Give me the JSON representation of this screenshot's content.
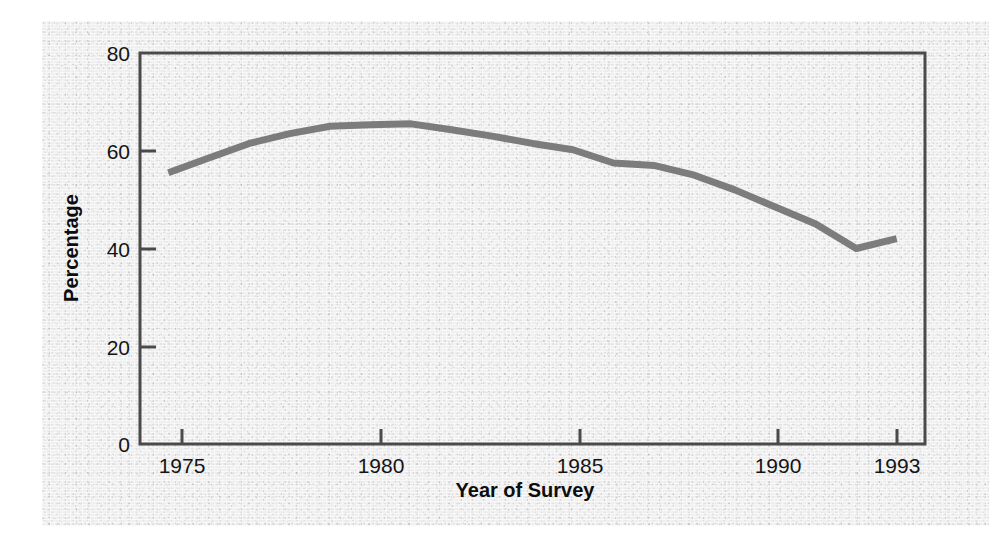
{
  "figure": {
    "background_color": "#efeff0",
    "page_color": "#ffffff"
  },
  "chart_data": {
    "type": "line",
    "title": "",
    "subtitle": "",
    "xlabel": "Year of Survey",
    "ylabel": "Percentage",
    "xlim": [
      1974.3,
      1993.7
    ],
    "ylim": [
      0,
      80
    ],
    "xticks": [
      1975,
      1980,
      1985,
      1990,
      1993
    ],
    "xtick_labels": [
      "1975",
      "1980",
      "1985",
      "1990",
      "1993"
    ],
    "yticks": [
      0,
      20,
      40,
      60,
      80
    ],
    "ytick_labels": [
      "0",
      "20",
      "40",
      "60",
      "80"
    ],
    "grid": false,
    "legend": false,
    "legend_position": "none",
    "annotations": [],
    "line_color": "#7c7c7c",
    "line_width": 7,
    "axis_color": "#4a4a4a",
    "x": [
      1975,
      1976,
      1977,
      1978,
      1979,
      1980,
      1981,
      1982,
      1983,
      1984,
      1985,
      1986,
      1987,
      1988,
      1989,
      1990,
      1991,
      1992,
      1993
    ],
    "values": [
      55.5,
      58.5,
      61.5,
      63.5,
      65.0,
      65.3,
      65.5,
      64.3,
      63.0,
      61.5,
      60.2,
      57.5,
      57.0,
      55.0,
      52.0,
      48.5,
      45.0,
      40.0,
      42.0
    ],
    "series": [
      {
        "name": "Percentage",
        "values": [
          55.5,
          58.5,
          61.5,
          63.5,
          65.0,
          65.3,
          65.5,
          64.3,
          63.0,
          61.5,
          60.2,
          57.5,
          57.0,
          55.0,
          52.0,
          48.5,
          45.0,
          40.0,
          42.0
        ]
      }
    ]
  }
}
